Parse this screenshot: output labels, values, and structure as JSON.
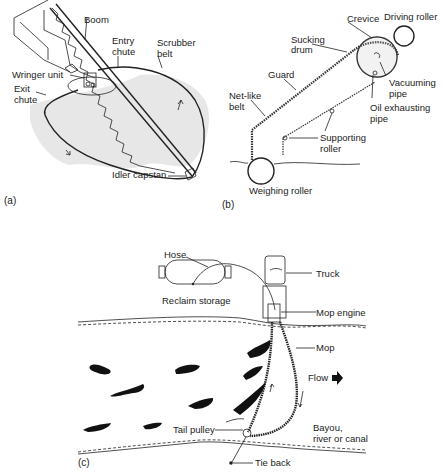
{
  "panels": {
    "a": {
      "caption": "(a)",
      "labels": {
        "boom": "Boom",
        "entry_chute_1": "Entry",
        "entry_chute_2": "chute",
        "scrubber_belt_1": "Scrubber",
        "scrubber_belt_2": "belt",
        "wringer_unit": "Wringer unit",
        "exit_chute_1": "Exit",
        "exit_chute_2": "chute",
        "idler_capstan": "Idler capstan"
      }
    },
    "b": {
      "caption": "(b)",
      "labels": {
        "crevice": "Crevice",
        "driving_roller": "Driving roller",
        "sucking_drum_1": "Sucking",
        "sucking_drum_2": "drum",
        "guard": "Guard",
        "net_like_belt_1": "Net-like",
        "net_like_belt_2": "belt",
        "vacuuming_pipe_1": "Vacuuming",
        "vacuuming_pipe_2": "pipe",
        "oil_exhausting_pipe_1": "Oil exhausting",
        "oil_exhausting_pipe_2": "pipe",
        "supporting_roller_1": "Supporting",
        "supporting_roller_2": "roller",
        "weighing_roller": "Weighing roller"
      }
    },
    "c": {
      "caption": "(c)",
      "labels": {
        "hose": "Hose",
        "truck": "Truck",
        "reclaim_storage": "Reclaim storage",
        "mop_engine": "Mop engine",
        "mop": "Mop",
        "flow": "Flow",
        "tail_pulley": "Tail pulley",
        "bayou_1": "Bayou,",
        "bayou_2": "river or canal",
        "tie_back": "Tie back"
      }
    }
  }
}
